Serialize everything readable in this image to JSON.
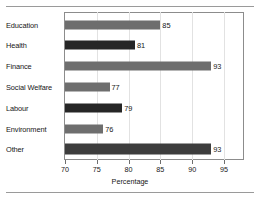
{
  "chart_data": {
    "type": "bar",
    "orientation": "horizontal",
    "title": "",
    "xlabel": "Percentage",
    "ylabel": "",
    "xlim": [
      70,
      98
    ],
    "xticks": [
      70,
      75,
      80,
      85,
      90,
      95
    ],
    "grid": true,
    "legend": null,
    "categories": [
      "Education",
      "Health",
      "Finance",
      "Social Welfare",
      "Labour",
      "Environment",
      "Other"
    ],
    "values": [
      85,
      81,
      93,
      77,
      79,
      76,
      93
    ],
    "value_labels": [
      "85",
      "81",
      "93",
      "77",
      "79",
      "76",
      "93"
    ],
    "bar_colors": [
      "#6e6e6e",
      "#262626",
      "#6e6e6e",
      "#6e6e6e",
      "#262626",
      "#6e6e6e",
      "#3d3d3d"
    ],
    "tick_labels": [
      "70",
      "75",
      "80",
      "85",
      "90",
      "95"
    ]
  },
  "axis": {
    "title": "Percentage"
  },
  "colors": {
    "bar_gray": "#6e6e6e",
    "bar_dark": "#262626",
    "frame": "#8c8c8c",
    "gridline": "#e2e2e2",
    "rule": "#9a9a9a"
  }
}
